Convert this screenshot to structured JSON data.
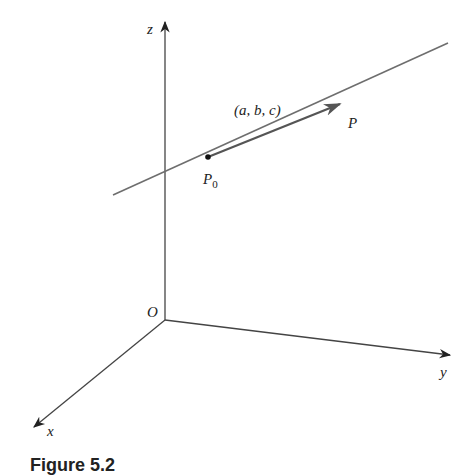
{
  "figure": {
    "caption": "Figure 5.2",
    "axes": {
      "z": {
        "label": "z",
        "tip": [
          165,
          20
        ]
      },
      "y": {
        "label": "y",
        "tip": [
          450,
          355
        ]
      },
      "x": {
        "label": "x",
        "tip": [
          33,
          428
        ]
      },
      "origin": {
        "label": "O",
        "point": [
          165,
          320
        ]
      }
    },
    "line": {
      "start": [
        113,
        195
      ],
      "end": [
        448,
        43
      ]
    },
    "point_p0": {
      "label": "P",
      "subscript": "0",
      "point": [
        208,
        157
      ]
    },
    "point_p": {
      "label": "P"
    },
    "direction_vector": {
      "label": "(a, b, c)",
      "tip": [
        340,
        104
      ]
    },
    "colors": {
      "axis": "#333333",
      "line": "#6e6e6e",
      "vector": "#5a5a5a",
      "text": "#222222"
    }
  }
}
